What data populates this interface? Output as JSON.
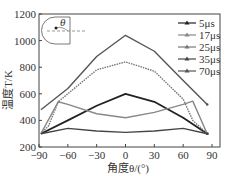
{
  "chart_data": {
    "type": "line",
    "title": "",
    "xlabel": "角度θ/(°)",
    "ylabel": "温度T/K",
    "xlim": [
      -90,
      90
    ],
    "ylim": [
      200,
      1200
    ],
    "xticks": [
      "-90",
      "-60",
      "-30",
      "0",
      "30",
      "60",
      "90"
    ],
    "yticks": [
      "200",
      "400",
      "600",
      "800",
      "1000",
      "1200"
    ],
    "legend": [
      "5μs",
      "17μs",
      "25μs",
      "35μs",
      "70μs"
    ],
    "legend_position": "upper right",
    "grid": false,
    "series": [
      {
        "name": "5μs",
        "color": "#222222",
        "x": [
          -88,
          -60,
          -30,
          0,
          30,
          60,
          85
        ],
        "values": [
          300,
          400,
          510,
          600,
          540,
          420,
          300
        ]
      },
      {
        "name": "17μs",
        "color": "#888888",
        "x": [
          -88,
          -70,
          -60,
          -30,
          0,
          30,
          60,
          70,
          85
        ],
        "values": [
          300,
          540,
          520,
          450,
          420,
          460,
          520,
          545,
          300
        ]
      },
      {
        "name": "25μs",
        "color": "#777777",
        "x": [
          -88,
          -80,
          -70,
          -60,
          -30,
          0,
          30,
          60,
          70,
          85
        ],
        "values": [
          300,
          360,
          540,
          600,
          780,
          840,
          770,
          560,
          400,
          300
        ]
      },
      {
        "name": "35μs",
        "color": "#444444",
        "x": [
          -88,
          -60,
          -30,
          0,
          30,
          60,
          85
        ],
        "values": [
          300,
          340,
          320,
          310,
          320,
          340,
          300
        ]
      },
      {
        "name": "70μs",
        "color": "#555555",
        "x": [
          -88,
          -60,
          -30,
          0,
          30,
          60,
          85
        ],
        "values": [
          480,
          640,
          880,
          1040,
          920,
          700,
          520
        ]
      }
    ],
    "inset": {
      "label": "θ"
    }
  }
}
